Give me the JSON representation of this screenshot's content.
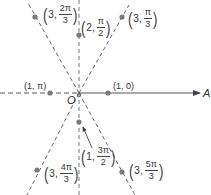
{
  "diagram": {
    "type": "polar-coordinate-plot",
    "origin_label": "O",
    "axis_label": "A",
    "colors": {
      "line": "#555555",
      "point": "#7a7a7a",
      "text": "#333333"
    },
    "rays": [
      {
        "angle": "π/3",
        "style": "dashed"
      },
      {
        "angle": "π/2",
        "style": "dashed"
      },
      {
        "angle": "2π/3",
        "style": "dashed"
      },
      {
        "angle": "π",
        "style": "dashed"
      },
      {
        "angle": "4π/3",
        "style": "dashed"
      },
      {
        "angle": "3π/2",
        "style": "dashed"
      },
      {
        "angle": "5π/3",
        "style": "dashed"
      },
      {
        "angle": "0",
        "style": "solid-arrow"
      }
    ],
    "points": [
      {
        "r": "1",
        "theta": "0",
        "label": "(1, 0)"
      },
      {
        "r": "1",
        "theta": "π",
        "label": "(1, π)"
      },
      {
        "r": "2",
        "theta_num": "π",
        "theta_den": "2",
        "r_label": "2,",
        "label": "(2, π/2)"
      },
      {
        "r": "3",
        "theta_num": "π",
        "theta_den": "3",
        "r_label": "3,",
        "label": "(3, π/3)"
      },
      {
        "r": "3",
        "theta_num": "2π",
        "theta_den": "3",
        "r_label": "3,",
        "label": "(3, 2π/3)"
      },
      {
        "r": "3",
        "theta_num": "4π",
        "theta_den": "3",
        "r_label": "3,",
        "label": "(3, 4π/3)"
      },
      {
        "r": "1",
        "theta_num": "3π",
        "theta_den": "2",
        "r_label": "1,",
        "label": "(1, 3π/2)"
      },
      {
        "r": "3",
        "theta_num": "5π",
        "theta_den": "3",
        "r_label": "3,",
        "label": "(3, 5π/3)"
      }
    ]
  }
}
